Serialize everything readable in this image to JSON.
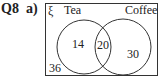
{
  "question": {
    "number": "Q8",
    "part": "a)"
  },
  "venn": {
    "universal_symbol": "ξ",
    "sets": [
      {
        "name": "Tea",
        "only": "14"
      },
      {
        "name": "Coffee",
        "only": "30"
      }
    ],
    "intersection": "20",
    "outside": "36"
  }
}
